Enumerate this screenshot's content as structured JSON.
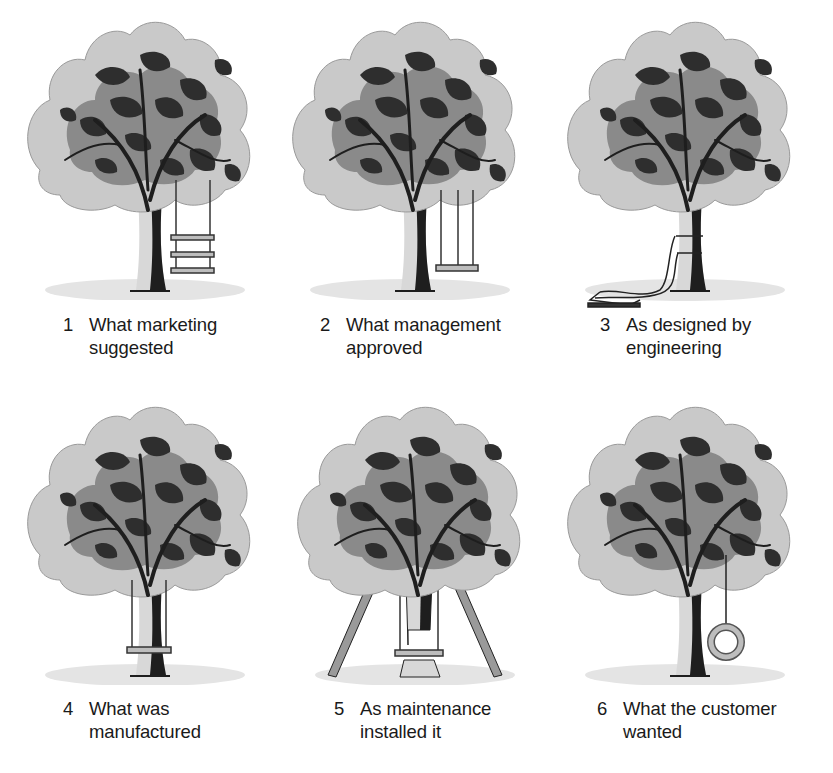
{
  "panels": [
    {
      "number": "1",
      "line1": "What marketing",
      "line2": "suggested",
      "swing": "three-seat-ladder-swing"
    },
    {
      "number": "2",
      "line1": "What management",
      "line2": "approved",
      "swing": "tall-two-rope-swing"
    },
    {
      "number": "3",
      "line1": "As designed by",
      "line2": "engineering",
      "swing": "seat-on-ground-ropes-tied-to-trunk"
    },
    {
      "number": "4",
      "line1": "What was",
      "line2": "manufactured",
      "swing": "swing-around-trunk"
    },
    {
      "number": "5",
      "line1": "As maintenance",
      "line2": "installed it",
      "swing": "cut-trunk-with-props"
    },
    {
      "number": "6",
      "line1": "What the customer",
      "line2": "wanted",
      "swing": "tire-swing"
    }
  ],
  "colors": {
    "foliage_light": "#c9c9c9",
    "foliage_mid": "#8a8a8a",
    "foliage_dark": "#2e2e2e",
    "trunk_light": "#d8d8d8",
    "trunk_dark": "#1e1e1e",
    "ground": "#e4e4e4"
  }
}
